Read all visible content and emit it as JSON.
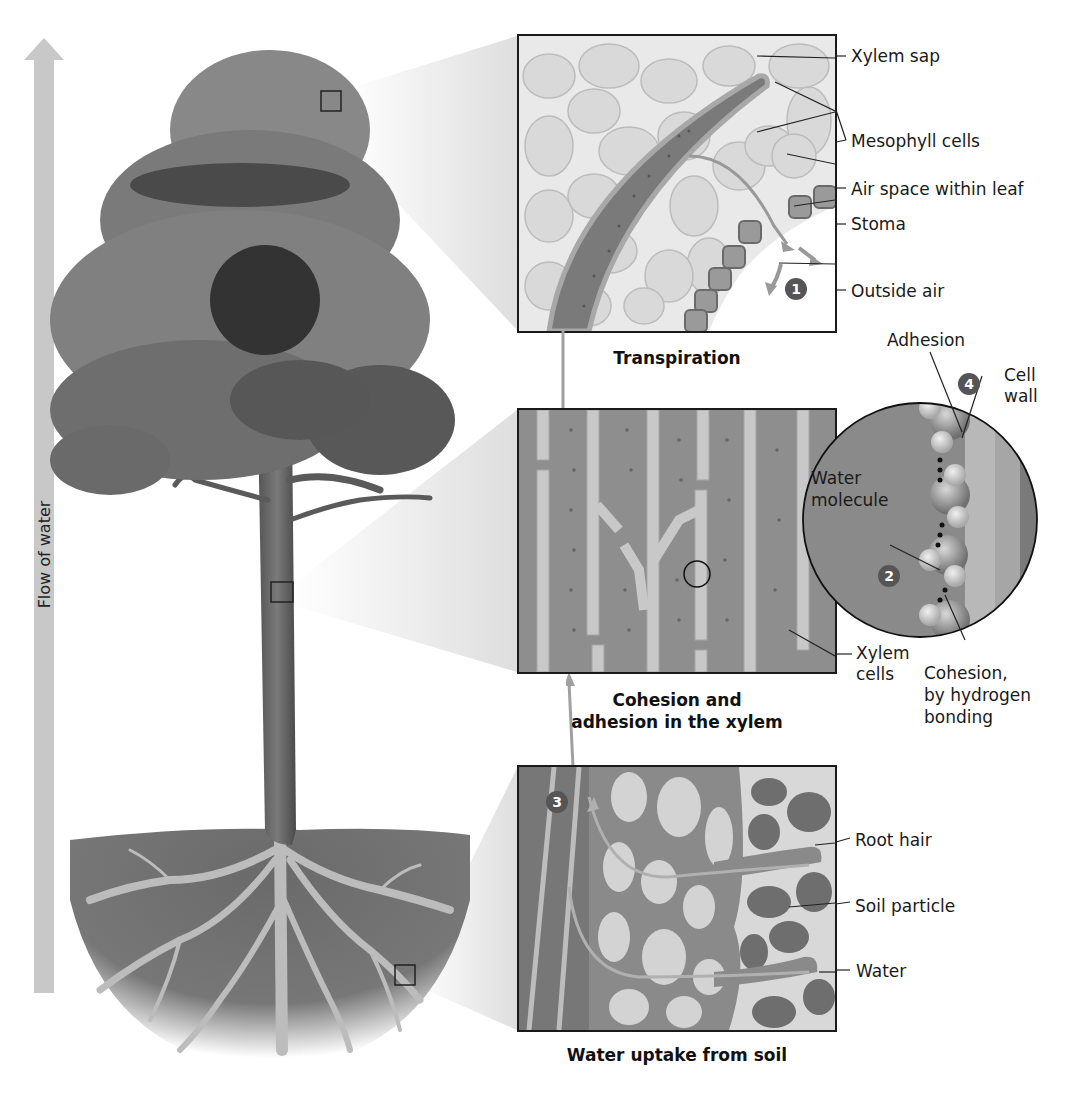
{
  "flow_arrow": {
    "label": "Flow of water",
    "color": "#c8c8c8"
  },
  "panels": {
    "transpiration": {
      "caption": "Transpiration",
      "step": "1",
      "labels": {
        "xylem_sap": "Xylem sap",
        "mesophyll": "Mesophyll cells",
        "air_space": "Air space within leaf",
        "stoma": "Stoma",
        "outside_air": "Outside air"
      }
    },
    "xylem": {
      "caption_line1": "Cohesion and",
      "caption_line2": "adhesion in the xylem",
      "labels": {
        "xylem_cells_line1": "Xylem",
        "xylem_cells_line2": "cells"
      }
    },
    "magnified": {
      "step_cohesion": "2",
      "step_adhesion": "4",
      "labels": {
        "adhesion": "Adhesion",
        "cell_wall_line1": "Cell",
        "cell_wall_line2": "wall",
        "water_molecule_line1": "Water",
        "water_molecule_line2": "molecule",
        "cohesion_line1": "Cohesion,",
        "cohesion_line2": "by hydrogen",
        "cohesion_line3": "bonding"
      }
    },
    "soil": {
      "caption": "Water uptake from soil",
      "step": "3",
      "labels": {
        "root_hair": "Root hair",
        "soil_particle": "Soil particle",
        "water": "Water"
      }
    }
  },
  "colors": {
    "canopy": "#7a7a7a",
    "canopy_dark": "#3e3e3e",
    "trunk": "#6a6a6a",
    "soil": "#6e6e6e",
    "roots": "#b9b9b9",
    "badge": "#555555"
  }
}
